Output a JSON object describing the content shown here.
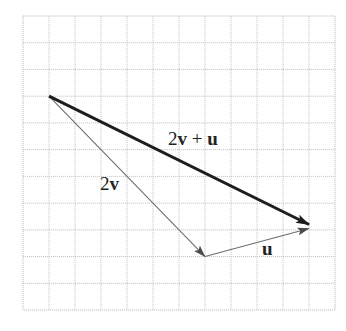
{
  "diagram": {
    "type": "vector-addition",
    "grid": {
      "columns": 12,
      "rows": 11,
      "origin_px": [
        23,
        16
      ],
      "cell_width_px": 26,
      "cell_height_px": 26.73,
      "line_color": "#c8c8c8"
    },
    "vectors": [
      {
        "id": "two-v",
        "label_parts": [
          {
            "text": "2",
            "bold": false
          },
          {
            "text": "v",
            "bold": true
          }
        ],
        "start_grid": [
          1,
          3
        ],
        "end_grid": [
          7,
          9
        ],
        "style": "thin",
        "color": "#6e6e6e"
      },
      {
        "id": "u",
        "label_parts": [
          {
            "text": "u",
            "bold": true
          }
        ],
        "start_grid": [
          7,
          9
        ],
        "end_grid": [
          11,
          7.95
        ],
        "style": "thin",
        "color": "#6e6e6e"
      },
      {
        "id": "two-v-plus-u",
        "label_parts": [
          {
            "text": "2",
            "bold": false
          },
          {
            "text": "v",
            "bold": true
          },
          {
            "text": " + ",
            "bold": false
          },
          {
            "text": "u",
            "bold": true
          }
        ],
        "start_grid": [
          1,
          3
        ],
        "end_grid": [
          11,
          7.8
        ],
        "style": "thick",
        "color": "#1e1e1e"
      }
    ],
    "labels": {
      "two_v": {
        "num": "2",
        "vec": "v"
      },
      "u": {
        "vec": "u"
      },
      "sum": {
        "num": "2",
        "vec1": "v",
        "op": " + ",
        "vec2": "u"
      }
    }
  }
}
